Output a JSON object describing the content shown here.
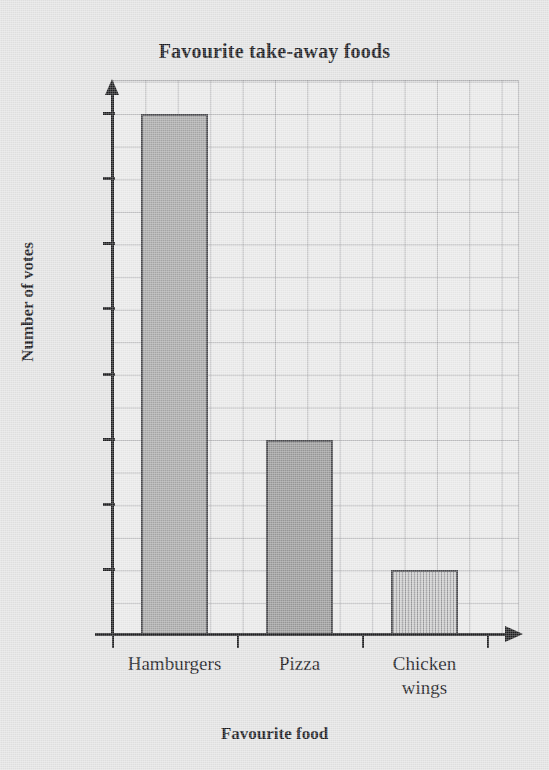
{
  "chart_data": {
    "type": "bar",
    "title": "Favourite take-away foods",
    "xlabel": "Favourite food",
    "ylabel": "Number of votes",
    "categories": [
      "Hamburgers",
      "Pizza",
      "Chicken wings"
    ],
    "values": [
      990,
      965,
      955
    ],
    "ylim": [
      950,
      990
    ],
    "yticks": [
      950,
      955,
      960,
      965,
      970,
      975,
      980,
      985,
      990
    ],
    "ytick_labels": [
      "950",
      "955",
      "960",
      "965",
      "970",
      "975",
      "980",
      "985",
      "990"
    ],
    "grid": true,
    "minor_grid": true,
    "legend": null,
    "bar_colors": [
      "#a8a8a8",
      "#999999",
      "#cdcdcd"
    ],
    "bar_edge_color": "#4a4a4e",
    "plot_background": "#eaeaea",
    "page_background": "#e3e3e3",
    "axis_color": "#1d1d1f",
    "grid_color": "#787a80",
    "text_color": "#16161a",
    "category_label_lines": [
      [
        "Hamburgers"
      ],
      [
        "Pizza"
      ],
      [
        "Chicken",
        "wings"
      ]
    ]
  }
}
